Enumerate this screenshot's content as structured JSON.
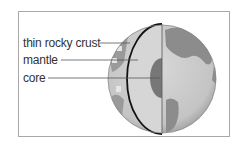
{
  "figure": {
    "type": "earth cross-section",
    "labels": [
      {
        "id": "crust",
        "text": "thin rocky crust"
      },
      {
        "id": "mantle",
        "text": "mantle"
      },
      {
        "id": "core",
        "text": "core"
      }
    ]
  },
  "colors": {
    "frame_border": "#a8a8a8",
    "ocean": "#cfcfcf",
    "land": "#8c8c8c",
    "mantle": "#d6d6d6",
    "core": "#777777",
    "outline": "#111111",
    "leader": "#555555",
    "text": "#333333"
  }
}
